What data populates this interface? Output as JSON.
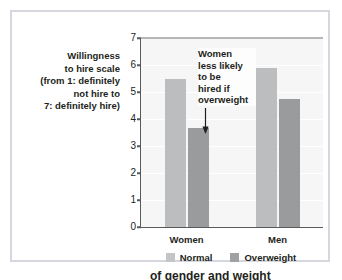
{
  "chart_data": {
    "type": "bar",
    "title": "",
    "subtitle": "",
    "xlabel": "",
    "ylabel": "Willingness to hire scale (from 1: definitely not hire to 7: definitely hire)",
    "ylabel_lines": [
      "Willingness",
      "to hire scale",
      "(from 1: definitely",
      "not hire to",
      "7: definitely hire)"
    ],
    "categories": [
      "Women",
      "Men"
    ],
    "series": [
      {
        "name": "Normal",
        "color": "#bcbdbf",
        "values": [
          5.5,
          5.9
        ]
      },
      {
        "name": "Overweight",
        "color": "#9a9b9d",
        "values": [
          3.65,
          4.75
        ]
      }
    ],
    "ylim": [
      0,
      7
    ],
    "yticks": [
      0,
      1,
      2,
      3,
      4,
      5,
      6,
      7
    ],
    "ytick_labels": [
      "0",
      "1",
      "2",
      "3",
      "4",
      "5",
      "6",
      "7"
    ],
    "grid": true,
    "grid_color": "#ffffff",
    "plot_background": "#f6f6f6",
    "legend_position": "bottom-center",
    "annotations": [
      {
        "text": "Women less likely to be hired if overweight",
        "lines": [
          "Women",
          "less likely",
          "to be",
          "hired if",
          "overweight"
        ],
        "icon": "down-arrow-icon",
        "target_series": "Overweight",
        "target_category": "Women"
      }
    ]
  },
  "figure": {
    "border_color": "#d6d6de",
    "background": "#ffffff",
    "clipped_caption": "of gender and weight"
  }
}
